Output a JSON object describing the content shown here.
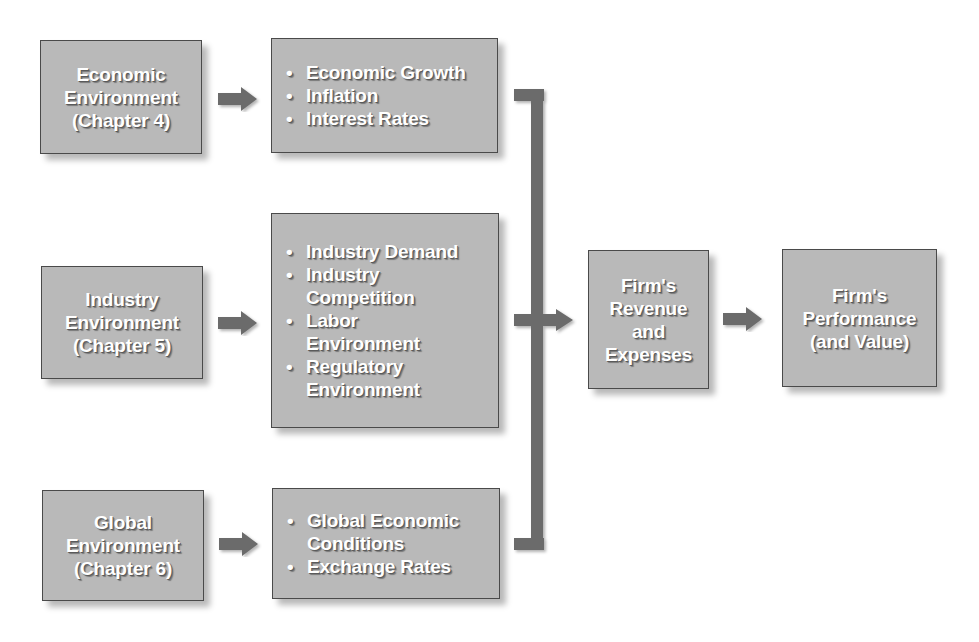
{
  "diagram": {
    "sources": [
      {
        "lines": [
          "Economic",
          "Environment",
          "(Chapter 4)"
        ]
      },
      {
        "lines": [
          "Industry",
          "Environment",
          "(Chapter 5)"
        ]
      },
      {
        "lines": [
          "Global",
          "Environment",
          "(Chapter 6)"
        ]
      }
    ],
    "factors": [
      {
        "items": [
          [
            "Economic Growth"
          ],
          [
            "Inflation"
          ],
          [
            "Interest Rates"
          ]
        ]
      },
      {
        "items": [
          [
            "Industry Demand"
          ],
          [
            "Industry",
            "Competition"
          ],
          [
            "Labor",
            "Environment"
          ],
          [
            "Regulatory",
            "Environment"
          ]
        ]
      },
      {
        "items": [
          [
            "Global Economic",
            "Conditions"
          ],
          [
            "Exchange Rates"
          ]
        ]
      }
    ],
    "revenue": {
      "lines": [
        "Firm's",
        "Revenue",
        "and",
        "Expenses"
      ]
    },
    "performance": {
      "lines": [
        "Firm's",
        "Performance",
        "(and Value)"
      ]
    },
    "bullet": "•",
    "colors": {
      "box_fill": "#b9b9b9",
      "box_border": "#4a4a4a",
      "arrow": "#6b6b6b",
      "text": "#ffffff"
    }
  }
}
